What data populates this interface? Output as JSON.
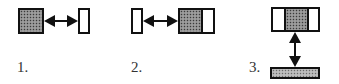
{
  "diagram": {
    "figures": [
      {
        "label": "1.",
        "description": "filled block left, double arrow, empty block right"
      },
      {
        "label": "2.",
        "description": "empty block left, double arrow, block with filled-left and empty-right parts"
      },
      {
        "label": "3.",
        "description": "top block empty-filled-empty, vertical double arrow, filled bar below"
      }
    ]
  },
  "colors": {
    "stroke": "#111111",
    "fill_dark": "#8a8a8a",
    "fill_light": "#b0b0b0",
    "label": "#333333"
  }
}
